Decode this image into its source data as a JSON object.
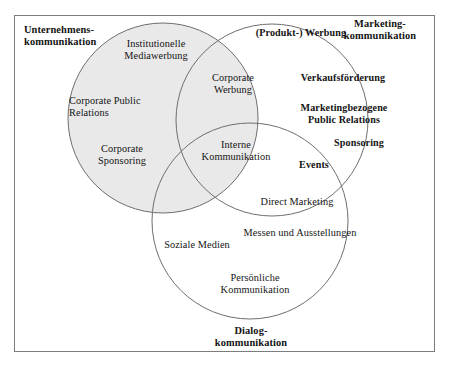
{
  "diagram": {
    "title_alt": "Venn-Diagramm der Unternehmenskommunikation",
    "colors": {
      "circle_fill_shaded": "#e9e9e9",
      "circle_stroke": "#6e6e6e",
      "frame_stroke": "#7d7d7d",
      "text": "#141414",
      "background": "#ffffff"
    }
  },
  "outer_labels": [
    {
      "id": "unternehmenskommunikation",
      "text": "Unternehmens-\nkommunikation"
    },
    {
      "id": "marketingkommunikation",
      "text": "Marketing-\nkommunikation"
    },
    {
      "id": "dialogkommunikation",
      "text": "Dialog-\nkommunikation"
    }
  ],
  "circles": {
    "left": {
      "name": "unternehmenskommunikation-circle",
      "cx": 163,
      "cy": 118,
      "r": 95,
      "shaded": true,
      "items": [
        {
          "id": "institutionelle-mediawerbung",
          "text": "Institutionelle\nMediawerbung"
        },
        {
          "id": "corporate-public-relations",
          "text": "Corporate Public\nRelations"
        },
        {
          "id": "corporate-sponsoring",
          "text": "Corporate\nSponsoring"
        }
      ]
    },
    "right": {
      "name": "marketingkommunikation-circle",
      "cx": 272,
      "cy": 120,
      "r": 96,
      "shaded": false,
      "items": [
        {
          "id": "produkt-werbung",
          "text": "(Produkt-) Werbung"
        },
        {
          "id": "verkaufsfoerderung",
          "text": "Verkaufsförderung"
        },
        {
          "id": "marketingbezogene-public-relations",
          "text": "Marketingbezogene\nPublic Relations"
        },
        {
          "id": "sponsoring",
          "text": "Sponsoring"
        },
        {
          "id": "events",
          "text": "Events"
        }
      ]
    },
    "bottom": {
      "name": "dialogkommunikation-circle",
      "cx": 250,
      "cy": 221,
      "r": 98,
      "shaded": false,
      "items": [
        {
          "id": "direct-marketing",
          "text": "Direct Marketing"
        },
        {
          "id": "messen-und-ausstellungen",
          "text": "Messen und Ausstellungen"
        },
        {
          "id": "soziale-medien",
          "text": "Soziale Medien"
        },
        {
          "id": "persoenliche-kommunikation",
          "text": "Persönliche\nKommunikation"
        }
      ]
    }
  },
  "intersections": [
    {
      "id": "corporate-werbung",
      "text": "Corporate\nWerbung",
      "between": "left+right"
    },
    {
      "id": "interne-kommunikation",
      "text": "Interne\nKommunikation",
      "between": "left+right+bottom"
    }
  ]
}
